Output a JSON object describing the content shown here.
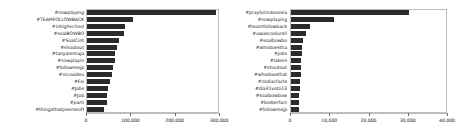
{
  "figure": {
    "background": "#ffffff",
    "bar_color": "#2b2b2b",
    "frame_color": "#bdbdbd",
    "text_color": "#1a1a1a"
  },
  "chart_data": [
    {
      "type": "bar",
      "orientation": "horizontal",
      "panel": "left",
      "title": "",
      "xlabel": "",
      "ylabel": "",
      "xlim": [
        0,
        300000
      ],
      "grid": false,
      "legend": null,
      "xticks": [
        0,
        100000,
        200000,
        300000
      ],
      "xticklabels": [
        "0",
        "100,000",
        "200,000",
        "300,000"
      ],
      "categories": [
        "#nowplaying",
        "#TEAMFOLLOWBACK",
        "#inhighschool",
        "#soalBOWBO",
        "#SoalCint",
        "#shoutout",
        "#tanyaremaja",
        "#nowplayin",
        "#followmejp",
        "#nicovideo",
        "#Fsi",
        "#Jobs",
        "#Job",
        "#parti",
        "#thingsthatpissmeoff"
      ],
      "values": [
        295000,
        105000,
        88000,
        84000,
        74000,
        68000,
        65000,
        63000,
        60000,
        58000,
        52000,
        48000,
        46000,
        45000,
        40000
      ]
    },
    {
      "type": "bar",
      "orientation": "horizontal",
      "panel": "right",
      "title": "",
      "xlabel": "",
      "ylabel": "",
      "xlim": [
        0,
        40000
      ],
      "grid": false,
      "legend": null,
      "xticks": [
        0,
        10000,
        20000,
        30000,
        40000
      ],
      "xticklabels": [
        "0",
        "10,000",
        "20,000",
        "30,000",
        "40,000"
      ],
      "categories": [
        "#prayforindonesia",
        "#nowplaying",
        "#teamfollowback",
        "#uwascooluntil",
        "#soalbowbo",
        "#whodoestha",
        "#jobs",
        "#lakers",
        "#shoutout",
        "#whodoesthat",
        "#zodiacfacts",
        "#dia31voto13",
        "#soalbowbow",
        "#bieberfact",
        "#followmejp"
      ],
      "values": [
        30500,
        11000,
        4800,
        3900,
        3100,
        2900,
        2750,
        2650,
        2600,
        2500,
        2400,
        2300,
        2150,
        2050,
        1950
      ]
    }
  ]
}
